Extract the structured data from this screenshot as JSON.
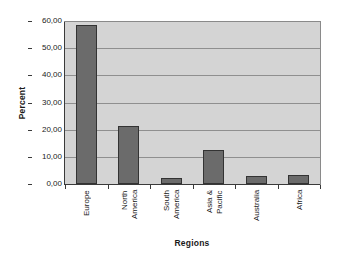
{
  "chart_data": {
    "type": "bar",
    "title": "",
    "xlabel": "Regions",
    "ylabel": "Percent",
    "categories": [
      "Europe",
      "North America",
      "South America",
      "Asia & Pacific",
      "Australia",
      "Africa"
    ],
    "category_lines": [
      [
        "Europe"
      ],
      [
        "North",
        "America"
      ],
      [
        "South",
        "America"
      ],
      [
        "Asia &",
        "Pacific"
      ],
      [
        "Australia"
      ],
      [
        "Africa"
      ]
    ],
    "values": [
      58.5,
      21.5,
      2.2,
      12.7,
      2.8,
      3.2
    ],
    "ylim": [
      0,
      60
    ],
    "ytick_step": 10,
    "ytick_labels": [
      "0,00",
      "10,00",
      "20,00",
      "30,00",
      "40,00",
      "50,00",
      "60,00"
    ],
    "ytick_values": [
      0,
      10,
      20,
      30,
      40,
      50,
      60
    ],
    "grid": true,
    "legend": false,
    "colors": {
      "bar_fill": "#6b6b6b",
      "bar_border": "#333333",
      "plot_background": "#d4d4d4",
      "gridline": "#8f8f8f",
      "axis": "#3a3a3a",
      "page_background": "#ffffff",
      "text": "#1a1a1a"
    }
  }
}
